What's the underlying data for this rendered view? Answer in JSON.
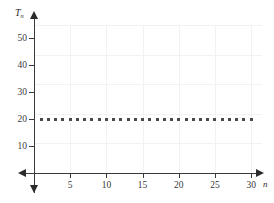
{
  "chart_data": {
    "type": "scatter",
    "title": "",
    "xlabel": "n",
    "ylabel": "Tₙ",
    "ylabel_base": "T",
    "ylabel_sub": "n",
    "x": [
      1,
      2,
      3,
      4,
      5,
      6,
      7,
      8,
      9,
      10,
      11,
      12,
      13,
      14,
      15,
      16,
      17,
      18,
      19,
      20,
      21,
      22,
      23,
      24,
      25,
      26,
      27,
      28,
      29,
      30
    ],
    "values": [
      20,
      20,
      20,
      20,
      20,
      20,
      20,
      20,
      20,
      20,
      20,
      20,
      20,
      20,
      20,
      20,
      20,
      20,
      20,
      20,
      20,
      20,
      20,
      20,
      20,
      20,
      20,
      20,
      20,
      20
    ],
    "series": [
      {
        "name": "T_n",
        "values": [
          20,
          20,
          20,
          20,
          20,
          20,
          20,
          20,
          20,
          20,
          20,
          20,
          20,
          20,
          20,
          20,
          20,
          20,
          20,
          20,
          20,
          20,
          20,
          20,
          20,
          20,
          20,
          20,
          20,
          20
        ]
      }
    ],
    "xlim": [
      0,
      31.5
    ],
    "ylim": [
      0,
      55
    ],
    "xticks": [
      5,
      10,
      15,
      20,
      25,
      30
    ],
    "xticklabels": [
      "5",
      "10",
      "15",
      "20",
      "25",
      "30"
    ],
    "yticks": [
      10,
      20,
      30,
      40,
      50
    ],
    "yticklabels": [
      "10",
      "20",
      "30",
      "40",
      "50"
    ],
    "grid": true,
    "grid_color": "#f2f2f3",
    "legend": null,
    "marker_color": "#4a4a4a",
    "axis_color": "#3a3a3a",
    "annotations": []
  }
}
